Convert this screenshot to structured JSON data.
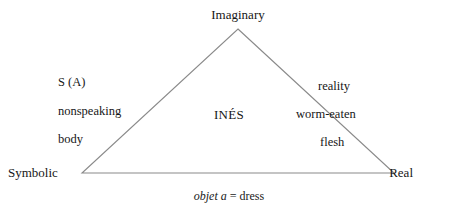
{
  "diagram": {
    "type": "lacanian-rsi-triangle",
    "stroke_color": "#8a8a8a",
    "text_color": "#161616",
    "background_color": "#ffffff",
    "vertices": {
      "apex": {
        "x": 238,
        "y": 29,
        "label": "Imaginary"
      },
      "bottom_left": {
        "x": 82,
        "y": 173,
        "label": "Symbolic"
      },
      "bottom_right": {
        "x": 394,
        "y": 173,
        "label": "Real"
      }
    },
    "corner_labels": {
      "top": "Imaginary",
      "bottom_left": "Symbolic",
      "bottom_right": "Real"
    },
    "left_column": {
      "line1": "S (A)",
      "line2": "nonspeaking",
      "line3": "body"
    },
    "right_column": {
      "line1": "reality",
      "line2": "worm-eaten",
      "line3": "flesh"
    },
    "center_label": "INÉS",
    "caption": {
      "italic_part": "objet a",
      "roman_part": "= dress",
      "full": "objet a = dress"
    }
  }
}
